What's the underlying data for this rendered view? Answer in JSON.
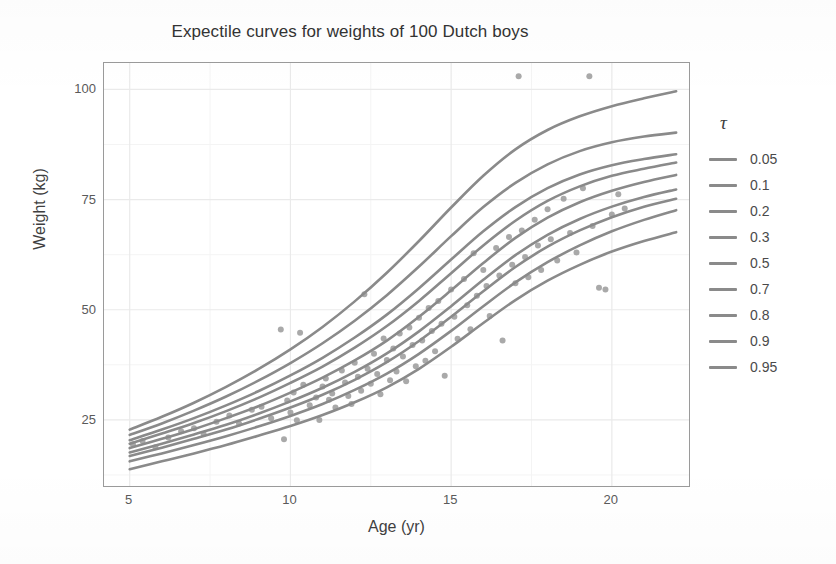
{
  "chart_data": {
    "type": "line",
    "title": "Expectile curves for weights of 100 Dutch boys",
    "xlabel": "Age (yr)",
    "ylabel": "Weight (kg)",
    "xlim": [
      4.2,
      22.4
    ],
    "ylim": [
      10,
      106
    ],
    "xticks": [
      5,
      10,
      15,
      20
    ],
    "yticks": [
      25,
      50,
      75,
      100
    ],
    "xtick_labels": [
      "5",
      "10",
      "15",
      "20"
    ],
    "ytick_labels": [
      "25",
      "50",
      "75",
      "100"
    ],
    "grid": true,
    "grid_major": true,
    "grid_minor": true,
    "legend_title": "τ",
    "legend_position": "right",
    "line_color": "#8a8a8a",
    "point_color": "#9a9a9a",
    "panel_background": "#ffffff",
    "grid_color": "#ededed",
    "series": [
      {
        "name": "0.05",
        "x": [
          5,
          6,
          7,
          8,
          9,
          10,
          11,
          12,
          13,
          14,
          15,
          16,
          17,
          18,
          19,
          20,
          21,
          22
        ],
        "values": [
          13.8,
          15.6,
          17.4,
          19.3,
          21.4,
          23.6,
          26.1,
          29.0,
          32.4,
          36.6,
          41.6,
          47.0,
          52.2,
          56.6,
          60.2,
          63.2,
          65.6,
          67.6
        ]
      },
      {
        "name": "0.1",
        "x": [
          5,
          6,
          7,
          8,
          9,
          10,
          11,
          12,
          13,
          14,
          15,
          16,
          17,
          18,
          19,
          20,
          21,
          22
        ],
        "values": [
          15.6,
          17.4,
          19.3,
          21.3,
          23.5,
          25.9,
          28.6,
          31.8,
          35.5,
          40.0,
          45.2,
          50.8,
          56.2,
          60.8,
          64.6,
          67.8,
          70.4,
          72.6
        ]
      },
      {
        "name": "0.2",
        "x": [
          5,
          6,
          7,
          8,
          9,
          10,
          11,
          12,
          13,
          14,
          15,
          16,
          17,
          18,
          19,
          20,
          21,
          22
        ],
        "values": [
          16.8,
          18.7,
          20.7,
          22.8,
          25.2,
          27.8,
          30.7,
          34.1,
          38.1,
          42.9,
          48.4,
          54.2,
          59.7,
          64.3,
          68.0,
          71.0,
          73.4,
          75.2
        ]
      },
      {
        "name": "0.3",
        "x": [
          5,
          6,
          7,
          8,
          9,
          10,
          11,
          12,
          13,
          14,
          15,
          16,
          17,
          18,
          19,
          20,
          21,
          22
        ],
        "values": [
          17.6,
          19.6,
          21.7,
          23.9,
          26.4,
          29.2,
          32.3,
          35.9,
          40.1,
          45.1,
          50.8,
          56.8,
          62.4,
          67.0,
          70.6,
          73.4,
          75.6,
          77.3
        ]
      },
      {
        "name": "0.5",
        "x": [
          5,
          6,
          7,
          8,
          9,
          10,
          11,
          12,
          13,
          14,
          15,
          16,
          17,
          18,
          19,
          20,
          21,
          22
        ],
        "values": [
          18.6,
          20.7,
          22.9,
          25.4,
          28.1,
          31.2,
          34.6,
          38.5,
          43.0,
          48.4,
          54.4,
          60.6,
          66.3,
          70.9,
          74.4,
          77.0,
          79.0,
          80.6
        ]
      },
      {
        "name": "0.7",
        "x": [
          5,
          6,
          7,
          8,
          9,
          10,
          11,
          12,
          13,
          14,
          15,
          16,
          17,
          18,
          19,
          20,
          21,
          22
        ],
        "values": [
          19.6,
          21.9,
          24.3,
          27.0,
          30.0,
          33.4,
          37.1,
          41.4,
          46.3,
          52.0,
          58.3,
          64.6,
          70.2,
          74.7,
          78.0,
          80.4,
          82.0,
          83.4
        ]
      },
      {
        "name": "0.8",
        "x": [
          5,
          6,
          7,
          8,
          9,
          10,
          11,
          12,
          13,
          14,
          15,
          16,
          17,
          18,
          19,
          20,
          21,
          22
        ],
        "values": [
          20.4,
          22.8,
          25.4,
          28.3,
          31.5,
          35.1,
          39.1,
          43.7,
          48.9,
          54.9,
          61.4,
          67.8,
          73.3,
          77.6,
          80.7,
          82.8,
          84.2,
          85.3
        ]
      },
      {
        "name": "0.9",
        "x": [
          5,
          6,
          7,
          8,
          9,
          10,
          11,
          12,
          13,
          14,
          15,
          16,
          17,
          18,
          19,
          20,
          21,
          22
        ],
        "values": [
          21.6,
          24.2,
          27.1,
          30.3,
          33.9,
          37.9,
          42.4,
          47.5,
          53.3,
          59.8,
          66.7,
          73.3,
          78.8,
          83.0,
          86.0,
          88.0,
          89.3,
          90.2
        ]
      },
      {
        "name": "0.95",
        "x": [
          5,
          6,
          7,
          8,
          9,
          10,
          11,
          12,
          13,
          14,
          15,
          16,
          17,
          18,
          19,
          20,
          21,
          22
        ],
        "values": [
          22.8,
          25.7,
          28.9,
          32.5,
          36.5,
          41.0,
          46.1,
          51.9,
          58.4,
          65.6,
          73.2,
          80.4,
          86.4,
          90.8,
          93.9,
          96.2,
          98.0,
          99.6
        ]
      }
    ],
    "scatter": {
      "name": "Dutch boys weight measurements",
      "n": 100,
      "points": [
        [
          5.1,
          19.5
        ],
        [
          5.4,
          20.2
        ],
        [
          5.8,
          18.8
        ],
        [
          6.2,
          21.0
        ],
        [
          6.6,
          22.4
        ],
        [
          7.0,
          23.1
        ],
        [
          7.3,
          21.8
        ],
        [
          7.7,
          24.6
        ],
        [
          8.1,
          26.0
        ],
        [
          8.4,
          24.2
        ],
        [
          8.8,
          27.3
        ],
        [
          9.1,
          28.0
        ],
        [
          9.4,
          25.4
        ],
        [
          9.7,
          45.5
        ],
        [
          9.8,
          20.6
        ],
        [
          9.9,
          29.4
        ],
        [
          10.0,
          26.7
        ],
        [
          10.1,
          31.2
        ],
        [
          10.2,
          24.9
        ],
        [
          10.3,
          44.8
        ],
        [
          10.4,
          33.0
        ],
        [
          10.6,
          28.3
        ],
        [
          10.8,
          30.1
        ],
        [
          10.9,
          25.0
        ],
        [
          11.0,
          32.6
        ],
        [
          11.1,
          34.4
        ],
        [
          11.2,
          29.6
        ],
        [
          11.3,
          31.0
        ],
        [
          11.4,
          27.8
        ],
        [
          11.6,
          36.2
        ],
        [
          11.7,
          33.5
        ],
        [
          11.8,
          30.4
        ],
        [
          11.9,
          28.6
        ],
        [
          12.0,
          38.0
        ],
        [
          12.1,
          34.8
        ],
        [
          12.2,
          31.6
        ],
        [
          12.3,
          53.5
        ],
        [
          12.4,
          36.6
        ],
        [
          12.5,
          33.2
        ],
        [
          12.6,
          40.0
        ],
        [
          12.7,
          35.4
        ],
        [
          12.8,
          30.8
        ],
        [
          12.9,
          43.5
        ],
        [
          13.0,
          38.6
        ],
        [
          13.1,
          34.0
        ],
        [
          13.2,
          41.2
        ],
        [
          13.3,
          36.0
        ],
        [
          13.4,
          44.6
        ],
        [
          13.5,
          39.4
        ],
        [
          13.6,
          33.8
        ],
        [
          13.7,
          46.0
        ],
        [
          13.8,
          42.0
        ],
        [
          13.9,
          37.2
        ],
        [
          14.0,
          48.2
        ],
        [
          14.1,
          43.0
        ],
        [
          14.2,
          38.4
        ],
        [
          14.3,
          50.4
        ],
        [
          14.4,
          45.2
        ],
        [
          14.5,
          40.6
        ],
        [
          14.6,
          52.0
        ],
        [
          14.7,
          46.8
        ],
        [
          14.8,
          35.0
        ],
        [
          15.0,
          54.6
        ],
        [
          15.1,
          48.4
        ],
        [
          15.2,
          43.4
        ],
        [
          15.4,
          57.0
        ],
        [
          15.5,
          51.0
        ],
        [
          15.6,
          45.6
        ],
        [
          15.7,
          62.8
        ],
        [
          15.8,
          53.2
        ],
        [
          16.0,
          59.0
        ],
        [
          16.1,
          55.4
        ],
        [
          16.2,
          48.6
        ],
        [
          16.4,
          64.0
        ],
        [
          16.5,
          57.8
        ],
        [
          16.6,
          43.0
        ],
        [
          16.8,
          66.5
        ],
        [
          16.9,
          60.2
        ],
        [
          17.0,
          56.0
        ],
        [
          17.1,
          103.0
        ],
        [
          17.2,
          68.0
        ],
        [
          17.3,
          62.0
        ],
        [
          17.4,
          57.4
        ],
        [
          17.6,
          70.4
        ],
        [
          17.7,
          64.6
        ],
        [
          17.8,
          59.0
        ],
        [
          18.0,
          72.8
        ],
        [
          18.1,
          66.0
        ],
        [
          18.3,
          61.2
        ],
        [
          18.5,
          75.2
        ],
        [
          18.7,
          67.4
        ],
        [
          18.9,
          63.0
        ],
        [
          19.1,
          77.6
        ],
        [
          19.3,
          103.0
        ],
        [
          19.4,
          69.0
        ],
        [
          19.6,
          55.0
        ],
        [
          19.8,
          54.6
        ],
        [
          20.0,
          71.6
        ],
        [
          20.2,
          76.2
        ],
        [
          20.4,
          73.0
        ]
      ]
    }
  },
  "legend": {
    "title": "τ",
    "entries": [
      {
        "label": "0.05"
      },
      {
        "label": "0.1"
      },
      {
        "label": "0.2"
      },
      {
        "label": "0.3"
      },
      {
        "label": "0.5"
      },
      {
        "label": "0.7"
      },
      {
        "label": "0.8"
      },
      {
        "label": "0.9"
      },
      {
        "label": "0.95"
      }
    ]
  }
}
